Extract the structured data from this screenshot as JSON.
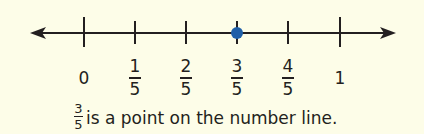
{
  "number_line": {
    "min": 0,
    "max": 1,
    "step": "1/5",
    "ticks": [
      {
        "type": "whole",
        "text": "0",
        "x": 84
      },
      {
        "type": "frac",
        "num": "1",
        "den": "5",
        "x": 135
      },
      {
        "type": "frac",
        "num": "2",
        "den": "5",
        "x": 186
      },
      {
        "type": "frac",
        "num": "3",
        "den": "5",
        "x": 237
      },
      {
        "type": "frac",
        "num": "4",
        "den": "5",
        "x": 288
      },
      {
        "type": "whole",
        "text": "1",
        "x": 340
      }
    ],
    "point": {
      "value": "3/5",
      "color": "#1f5fa8"
    }
  },
  "caption": {
    "num": "3",
    "den": "5",
    "text": "is a point on the number line."
  }
}
